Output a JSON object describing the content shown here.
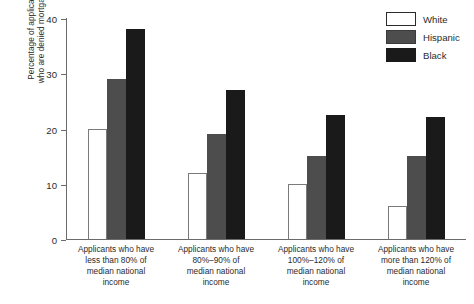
{
  "chart_data": {
    "type": "bar",
    "title": "",
    "subtitle": "",
    "xlabel": "",
    "ylabel_line1": "Percentage of applicants",
    "ylabel_line2": "who are denied mortgages",
    "ylabel": "Percentage of applicants who are denied mortgages",
    "ylim": [
      0,
      40
    ],
    "yticks": [
      0,
      10,
      20,
      30,
      40
    ],
    "ytick_labels": [
      "0",
      "10",
      "20",
      "30",
      "40"
    ],
    "grid": false,
    "legend_position": "top-right",
    "categories": [
      "Applicants who have less than 80% of median national income",
      "Applicants who have 80%–90% of median national income",
      "Applicants who have 100%–120% of median national income",
      "Applicants who have more than 120% of median national income"
    ],
    "category_lines": [
      [
        "Applicants who have",
        "less than 80% of",
        "median national",
        "income"
      ],
      [
        "Applicants who have",
        "80%–90% of",
        "median national",
        "income"
      ],
      [
        "Applicants who have",
        "100%–120% of",
        "median national",
        "income"
      ],
      [
        "Applicants who have",
        "more than 120% of",
        "median national",
        "income"
      ]
    ],
    "series": [
      {
        "name": "White",
        "color": "#ffffff",
        "values": [
          20,
          12,
          10,
          6
        ]
      },
      {
        "name": "Hispanic",
        "color": "#4d4d4d",
        "values": [
          29,
          19,
          15,
          15
        ]
      },
      {
        "name": "Black",
        "color": "#1a1a1a",
        "values": [
          38,
          27,
          22.5,
          22
        ]
      }
    ]
  },
  "legend": {
    "items": [
      {
        "label": "White"
      },
      {
        "label": "Hispanic"
      },
      {
        "label": "Black"
      }
    ]
  }
}
